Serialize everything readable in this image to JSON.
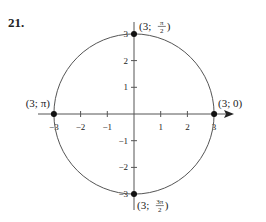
{
  "problem_number": "21.",
  "chart_data": {
    "type": "scatter",
    "title": "",
    "xlim": [
      -3.5,
      3.5
    ],
    "ylim": [
      -3.2,
      3.2
    ],
    "x_ticks": [
      -3,
      -2,
      -1,
      1,
      2,
      3
    ],
    "x_tick_labels": [
      "−3",
      "−2",
      "−1",
      "1",
      "2",
      "3"
    ],
    "y_ticks": [
      -3,
      -2,
      -1,
      1,
      2,
      3
    ],
    "y_tick_labels": [
      "−3",
      "−2",
      "−1",
      "1",
      "2",
      "3"
    ],
    "circle": {
      "center": [
        0,
        0
      ],
      "radius": 3
    },
    "points": [
      {
        "x": 3,
        "y": 0,
        "label": "(3; 0)"
      },
      {
        "x": 0,
        "y": 3,
        "label_prefix": "(3; ",
        "frac_num": "π",
        "frac_den": "2",
        "label_suffix": ")"
      },
      {
        "x": -3,
        "y": 0,
        "label": "(3; π)"
      },
      {
        "x": 0,
        "y": -3,
        "label_prefix": "(3; ",
        "frac_num": "3π",
        "frac_den": "2",
        "label_suffix": ")"
      }
    ],
    "grid": false,
    "legend": "none"
  }
}
